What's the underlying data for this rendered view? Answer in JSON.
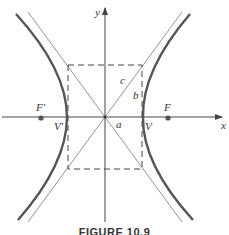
{
  "diagram": {
    "axes": {
      "x_label": "x",
      "y_label": "y"
    },
    "points": [
      {
        "id": "F_prime",
        "label": "F′"
      },
      {
        "id": "V_prime",
        "label": "V′"
      },
      {
        "id": "V",
        "label": "V"
      },
      {
        "id": "F",
        "label": "F"
      }
    ],
    "segment_labels": {
      "a": "a",
      "b": "b",
      "c": "c"
    },
    "colors": {
      "curve": "#555555",
      "lines": "#666666",
      "background": "#ffffff"
    }
  },
  "caption": "FIGURE 10.9"
}
